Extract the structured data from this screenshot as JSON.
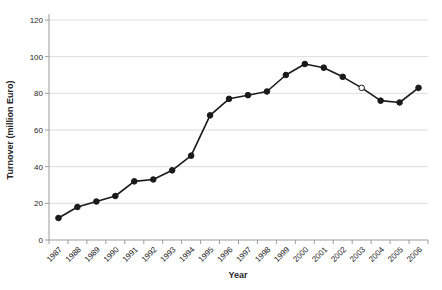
{
  "chart_data": {
    "type": "line",
    "title": "",
    "xlabel": "Year",
    "ylabel": "Turnover (million Euro)",
    "x": [
      "1987",
      "1988",
      "1989",
      "1990",
      "1991",
      "1992",
      "1993",
      "1994",
      "1995",
      "1996",
      "1997",
      "1998",
      "1999",
      "2000",
      "2001",
      "2002",
      "2003",
      "2004",
      "2005",
      "2006"
    ],
    "series": [
      {
        "name": "Turnover (million Euro)",
        "values": [
          12,
          18,
          21,
          24,
          32,
          33,
          38,
          46,
          68,
          77,
          79,
          81,
          90,
          96,
          94,
          89,
          83,
          76,
          75,
          83
        ]
      }
    ],
    "ylim": [
      0,
      120
    ],
    "yticks": [
      0,
      20,
      40,
      60,
      80,
      100,
      120
    ],
    "grid": "horizontal",
    "legend": "none",
    "marker": "circle",
    "hollow_marker_indices": [
      16
    ],
    "hollow_marker_year": "2003"
  },
  "colors": {
    "background": "#ffffff",
    "line": "#1a1a1a",
    "marker_fill": "#1a1a1a",
    "hollow_marker_fill": "#ffffff",
    "grid": "#dcdcdc",
    "axis": "#9c9c9c",
    "text": "#262626"
  }
}
